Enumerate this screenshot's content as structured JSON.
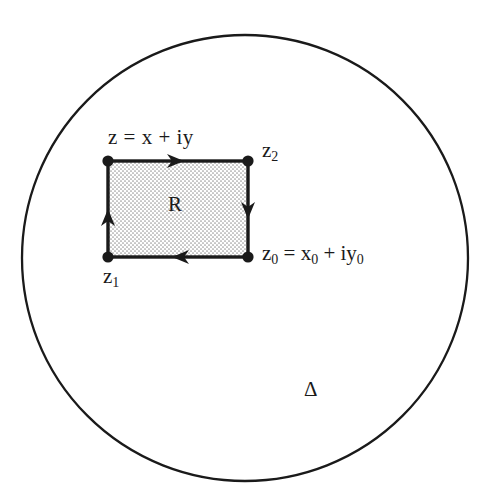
{
  "figure": {
    "type": "complex-analysis-contour-diagram",
    "background_color": "#ffffff",
    "stroke_color": "#1a1a1a",
    "fill_color": "#d9d9d9",
    "domain_circle": {
      "name": "Delta",
      "label": "Δ",
      "center_x": 245,
      "center_y": 258,
      "radius": 223,
      "stroke_width": 2.2
    },
    "rectangle": {
      "name": "R",
      "label": "R",
      "left": 108,
      "top": 161,
      "right": 248,
      "bottom": 257,
      "stroke_width": 3.4,
      "fill_pattern": "stipple-dots"
    },
    "vertices": [
      {
        "id": "top-left",
        "label": "z = x + iy",
        "x": 108,
        "y": 161
      },
      {
        "id": "top-right",
        "label": "z₂",
        "x": 248,
        "y": 161
      },
      {
        "id": "bottom-right",
        "label": "z₀ = x₀ + iy₀",
        "x": 248,
        "y": 257
      },
      {
        "id": "bottom-left",
        "label": "z₁",
        "x": 108,
        "y": 257
      }
    ],
    "orientation": "counterclockwise",
    "edge_arrows": [
      {
        "edge": "top",
        "direction": "right",
        "x": 178,
        "y": 161
      },
      {
        "edge": "right",
        "direction": "down",
        "x": 248,
        "y": 212
      },
      {
        "edge": "bottom",
        "direction": "left",
        "x": 178,
        "y": 257
      },
      {
        "edge": "left",
        "direction": "up",
        "x": 108,
        "y": 215
      }
    ],
    "labels": {
      "z_top_left": {
        "text": "z = x + iy",
        "x": 108,
        "y": 130
      },
      "z2": {
        "base": "z",
        "subscript": "2",
        "x": 262,
        "y": 142
      },
      "z0_equation": {
        "base1": "z",
        "sub1": "0",
        "equals": " = ",
        "base2": "x",
        "sub2": "0",
        "plus": " + i",
        "base3": "y",
        "sub3": "0",
        "x": 262,
        "y": 245
      },
      "z1": {
        "base": "z",
        "subscript": "1",
        "x": 103,
        "y": 268
      },
      "region_R": {
        "text": "R",
        "x": 168,
        "y": 196
      },
      "domain_delta": {
        "text": "Δ",
        "x": 304,
        "y": 380
      }
    }
  }
}
